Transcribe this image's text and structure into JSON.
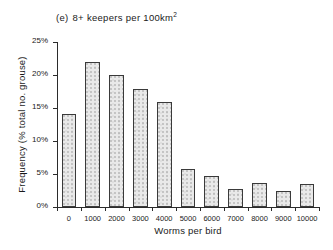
{
  "chart_data": {
    "type": "bar",
    "title_tag": "(e)",
    "title_text": "8+ keepers per 100km",
    "title_sup": "2",
    "xlabel": "Worms per bird",
    "ylabel": "Frequency (% total no. grouse)",
    "categories": [
      "0",
      "1000",
      "2000",
      "3000",
      "4000",
      "5000",
      "6000",
      "7000",
      "8000",
      "9000",
      "10000"
    ],
    "values": [
      14.1,
      22.0,
      20.0,
      17.9,
      15.9,
      5.7,
      4.7,
      2.7,
      3.6,
      2.5,
      3.5
    ],
    "ylim": [
      0,
      25
    ],
    "ytick_values": [
      0,
      5,
      10,
      15,
      20,
      25
    ],
    "ytick_labels": [
      "0%",
      "5%",
      "10%",
      "15%",
      "20%",
      "25%"
    ],
    "grid": false,
    "legend": "none",
    "bar_fill_color": "#e9e9e9",
    "bar_edge_color": "#3a3a3a",
    "axis_color": "#2b2b2b"
  }
}
